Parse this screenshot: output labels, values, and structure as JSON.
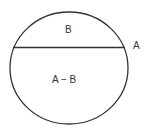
{
  "diagram": {
    "labels": {
      "upper_segment": "B",
      "lower_segment": "A − B",
      "whole": "A"
    },
    "colors": {
      "stroke": "#333333",
      "background": "#ffffff"
    }
  }
}
